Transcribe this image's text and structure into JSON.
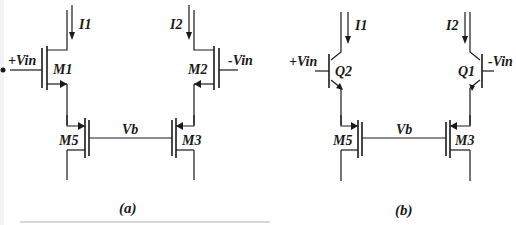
{
  "figure": {
    "panels": [
      {
        "id": "a",
        "caption": "(a)",
        "type": "MOSFET differential pair with current-source loads",
        "labels": {
          "current_left": "I1",
          "current_right": "I2",
          "input_left": "+Vin",
          "input_right": "-Vin",
          "device_top_left": "M1",
          "device_top_right": "M2",
          "device_bottom_left": "M5",
          "device_bottom_right": "M3",
          "bias": "Vb"
        }
      },
      {
        "id": "b",
        "caption": "(b)",
        "type": "BJT differential pair with MOSFET current-source loads",
        "labels": {
          "current_left": "I1",
          "current_right": "I2",
          "input_left": "+Vin",
          "input_right": "-Vin",
          "device_top_left": "Q2",
          "device_top_right": "Q1",
          "device_bottom_left": "M5",
          "device_bottom_right": "M3",
          "bias": "Vb"
        }
      }
    ]
  },
  "colors": {
    "ink": "#1a1a1a",
    "background": "#ffffff"
  }
}
